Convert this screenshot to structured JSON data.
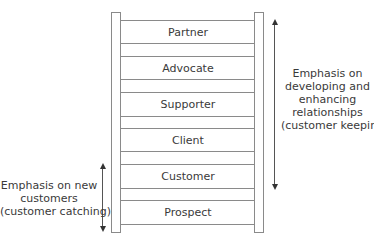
{
  "diagram": {
    "steps_top_to_bottom": [
      "Partner",
      "Advocate",
      "Supporter",
      "Client",
      "Customer",
      "Prospect"
    ],
    "steps": {
      "partner": "Partner",
      "advocate": "Advocate",
      "supporter": "Supporter",
      "client": "Client",
      "customer": "Customer",
      "prospect": "Prospect"
    },
    "right_note": {
      "lines": [
        "Emphasis on",
        "developing and",
        "enhancing",
        "relationships",
        "(customer keeping)"
      ],
      "spans": "Partner to Customer"
    },
    "left_note": {
      "lines": [
        "Emphasis on new",
        "customers",
        "(customer catching)"
      ],
      "spans": "Customer to Prospect"
    },
    "colors": {
      "line": "#8a8a8a",
      "text": "#3a3a3a",
      "arrow": "#333333",
      "background": "#ffffff"
    }
  }
}
